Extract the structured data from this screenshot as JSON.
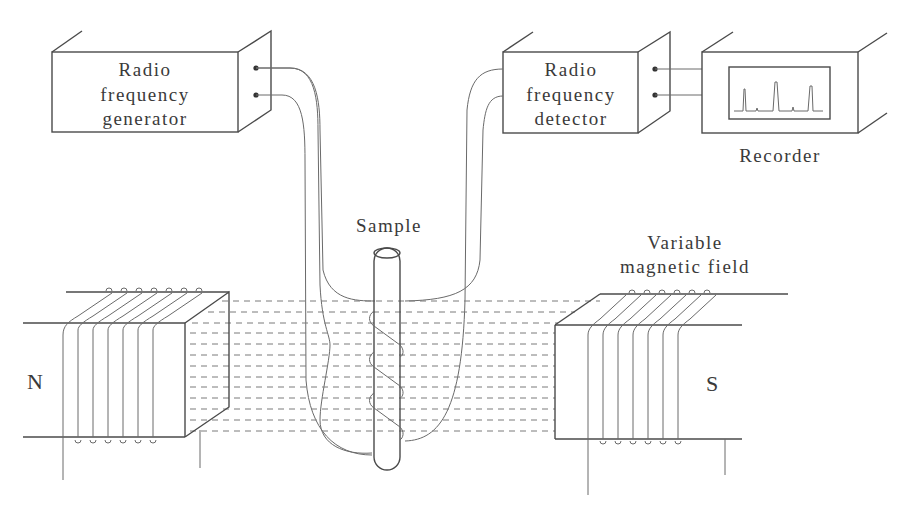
{
  "diagram": {
    "components": {
      "generator": {
        "lines": [
          "Radio",
          "frequency",
          "generator"
        ]
      },
      "detector": {
        "lines": [
          "Radio",
          "frequency",
          "detector"
        ]
      },
      "recorder": {
        "label": "Recorder"
      },
      "sample": {
        "label": "Sample"
      },
      "field": {
        "lines": [
          "Variable",
          "magnetic field"
        ]
      },
      "north_pole": {
        "label": "N"
      },
      "south_pole": {
        "label": "S"
      }
    },
    "colors": {
      "line": "#4a4a4a",
      "text": "#3a3a3a",
      "background": "#ffffff"
    }
  }
}
